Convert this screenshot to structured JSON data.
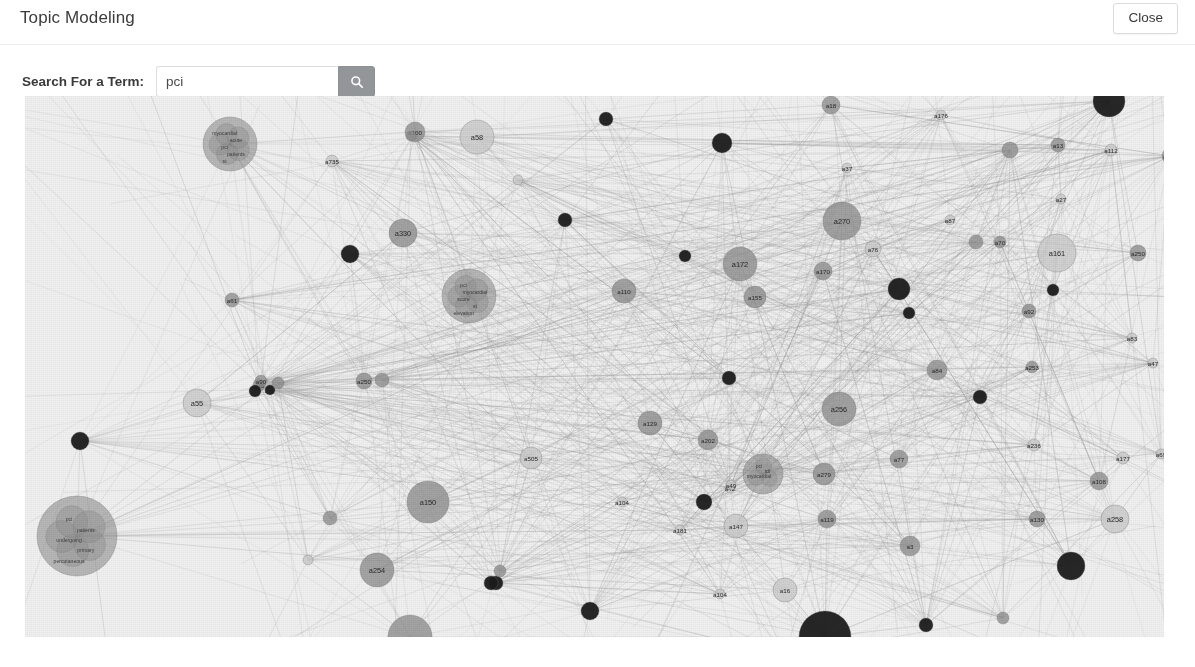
{
  "header": {
    "title": "Topic Modeling",
    "close_label": "Close"
  },
  "search": {
    "label": "Search For a Term:",
    "value": "pci",
    "placeholder": "",
    "button_icon": "search-icon"
  },
  "graph": {
    "type": "force-directed-network",
    "background_color": "#f1f1f1",
    "edge_color": "#9a9a9a",
    "node_fill_dark": "#1b1b1b",
    "node_fill_mid": "#8e8e8e",
    "node_fill_light": "#c9c9c9",
    "node_stroke": "#6f6f6f",
    "nodes": [
      {
        "id": "a137",
        "label": "a137",
        "x": 55,
        "y": 345,
        "r": 9,
        "tone": "dark"
      },
      {
        "id": "a55",
        "label": "a55",
        "x": 172,
        "y": 307,
        "r": 14,
        "tone": "light"
      },
      {
        "id": "a61",
        "label": "a61",
        "x": 207,
        "y": 204,
        "r": 7,
        "tone": "mid"
      },
      {
        "id": "a35",
        "label": "a35",
        "x": 234,
        "y": 289,
        "r": 6,
        "tone": "mid"
      },
      {
        "id": "a07",
        "label": "a07",
        "x": 245,
        "y": 294,
        "r": 5,
        "tone": "dark"
      },
      {
        "id": "a90",
        "label": "a90",
        "x": 236,
        "y": 285,
        "r": 6,
        "tone": "mid"
      },
      {
        "id": "c1",
        "label": "",
        "x": 205,
        "y": 48,
        "r": 27,
        "tone": "mid",
        "cluster": true,
        "terms": [
          "myocardial",
          "acute",
          "pci",
          "patients",
          "st"
        ]
      },
      {
        "id": "a735",
        "label": "a735",
        "x": 307,
        "y": 65,
        "r": 6,
        "tone": "light"
      },
      {
        "id": "a100",
        "label": "a100",
        "x": 390,
        "y": 36,
        "r": 10,
        "tone": "mid"
      },
      {
        "id": "a58",
        "label": "a58",
        "x": 452,
        "y": 41,
        "r": 17,
        "tone": "light"
      },
      {
        "id": "a330",
        "label": "a330",
        "x": 378,
        "y": 137,
        "r": 14,
        "tone": "mid"
      },
      {
        "id": "a81",
        "label": "",
        "x": 325,
        "y": 158,
        "r": 9,
        "tone": "dark"
      },
      {
        "id": "a250b",
        "label": "a250",
        "x": 339,
        "y": 285,
        "r": 8,
        "tone": "mid"
      },
      {
        "id": "a25",
        "label": "",
        "x": 230,
        "y": 295,
        "r": 6,
        "tone": "dark"
      },
      {
        "id": "a150",
        "label": "a150",
        "x": 403,
        "y": 406,
        "r": 21,
        "tone": "mid"
      },
      {
        "id": "a254",
        "label": "a254",
        "x": 352,
        "y": 474,
        "r": 17,
        "tone": "mid"
      },
      {
        "id": "a24",
        "label": "",
        "x": 305,
        "y": 422,
        "r": 7,
        "tone": "mid"
      },
      {
        "id": "c2",
        "label": "",
        "x": 444,
        "y": 200,
        "r": 27,
        "tone": "light",
        "cluster": true,
        "terms": [
          "pci",
          "myocardial",
          "score",
          "st",
          "elevation",
          "mi"
        ]
      },
      {
        "id": "a505",
        "label": "a505",
        "x": 506,
        "y": 362,
        "r": 11,
        "tone": "light"
      },
      {
        "id": "a99",
        "label": "",
        "x": 471,
        "y": 487,
        "r": 7,
        "tone": "dark"
      },
      {
        "id": "a270b",
        "label": "a270",
        "x": 565,
        "y": 515,
        "r": 9,
        "tone": "dark"
      },
      {
        "id": "a104",
        "label": "a104",
        "x": 597,
        "y": 406,
        "r": 5,
        "tone": "light"
      },
      {
        "id": "a110",
        "label": "a110",
        "x": 599,
        "y": 195,
        "r": 12,
        "tone": "mid"
      },
      {
        "id": "a172",
        "label": "a172",
        "x": 715,
        "y": 168,
        "r": 17,
        "tone": "mid"
      },
      {
        "id": "a155",
        "label": "a155",
        "x": 730,
        "y": 201,
        "r": 11,
        "tone": "mid"
      },
      {
        "id": "a170",
        "label": "a170",
        "x": 697,
        "y": 47,
        "r": 10,
        "tone": "dark"
      },
      {
        "id": "a129",
        "label": "a129",
        "x": 625,
        "y": 327,
        "r": 12,
        "tone": "mid"
      },
      {
        "id": "a202",
        "label": "a202",
        "x": 683,
        "y": 344,
        "r": 10,
        "tone": "mid"
      },
      {
        "id": "a42",
        "label": "a42",
        "x": 705,
        "y": 392,
        "r": 5,
        "tone": "light"
      },
      {
        "id": "a240",
        "label": "a240",
        "x": 679,
        "y": 406,
        "r": 8,
        "tone": "dark"
      },
      {
        "id": "a181",
        "label": "a181",
        "x": 655,
        "y": 434,
        "r": 5,
        "tone": "light"
      },
      {
        "id": "a147",
        "label": "a147",
        "x": 711,
        "y": 430,
        "r": 12,
        "tone": "light"
      },
      {
        "id": "a49",
        "label": "a49",
        "x": 706,
        "y": 389,
        "r": 5,
        "tone": "light"
      },
      {
        "id": "c3",
        "label": "",
        "x": 738,
        "y": 378,
        "r": 20,
        "tone": "mid",
        "cluster": true,
        "terms": [
          "pci",
          "tdi",
          "myocardial"
        ]
      },
      {
        "id": "a279",
        "label": "a279",
        "x": 799,
        "y": 378,
        "r": 11,
        "tone": "mid"
      },
      {
        "id": "a119",
        "label": "a119",
        "x": 802,
        "y": 423,
        "r": 9,
        "tone": "mid"
      },
      {
        "id": "a3",
        "label": "a3",
        "x": 885,
        "y": 450,
        "r": 10,
        "tone": "mid"
      },
      {
        "id": "a16",
        "label": "a16",
        "x": 760,
        "y": 494,
        "r": 12,
        "tone": "light"
      },
      {
        "id": "a104b",
        "label": "a104",
        "x": 695,
        "y": 498,
        "r": 5,
        "tone": "light"
      },
      {
        "id": "a173",
        "label": "a173",
        "x": 760,
        "y": 560,
        "r": 7,
        "tone": "mid"
      },
      {
        "id": "a256",
        "label": "a256",
        "x": 814,
        "y": 313,
        "r": 17,
        "tone": "mid"
      },
      {
        "id": "a270",
        "label": "a270",
        "x": 817,
        "y": 125,
        "r": 19,
        "tone": "mid"
      },
      {
        "id": "a76",
        "label": "a76",
        "x": 848,
        "y": 153,
        "r": 8,
        "tone": "light"
      },
      {
        "id": "a170b",
        "label": "a170",
        "x": 798,
        "y": 175,
        "r": 9,
        "tone": "mid"
      },
      {
        "id": "a48",
        "label": "a48",
        "x": 874,
        "y": 193,
        "r": 11,
        "tone": "dark"
      },
      {
        "id": "a18",
        "label": "a18",
        "x": 806,
        "y": 9,
        "r": 9,
        "tone": "mid"
      },
      {
        "id": "a37",
        "label": "a37",
        "x": 822,
        "y": 72,
        "r": 5,
        "tone": "light"
      },
      {
        "id": "a87",
        "label": "a87",
        "x": 925,
        "y": 124,
        "r": 5,
        "tone": "light"
      },
      {
        "id": "a70",
        "label": "a70",
        "x": 975,
        "y": 146,
        "r": 6,
        "tone": "mid"
      },
      {
        "id": "a176",
        "label": "a176",
        "x": 916,
        "y": 19,
        "r": 5,
        "tone": "light"
      },
      {
        "id": "a13",
        "label": "a13",
        "x": 1033,
        "y": 49,
        "r": 7,
        "tone": "mid"
      },
      {
        "id": "a112",
        "label": "a112",
        "x": 1086,
        "y": 54,
        "r": 6,
        "tone": "light"
      },
      {
        "id": "a160",
        "label": "a160",
        "x": 1145,
        "y": 60,
        "r": 8,
        "tone": "mid"
      },
      {
        "id": "a27",
        "label": "a27",
        "x": 1036,
        "y": 103,
        "r": 5,
        "tone": "light"
      },
      {
        "id": "a161",
        "label": "a161",
        "x": 1032,
        "y": 157,
        "r": 19,
        "tone": "light"
      },
      {
        "id": "a250",
        "label": "a250",
        "x": 1113,
        "y": 157,
        "r": 8,
        "tone": "mid"
      },
      {
        "id": "a90b",
        "label": "",
        "x": 1028,
        "y": 194,
        "r": 6,
        "tone": "dark"
      },
      {
        "id": "a92",
        "label": "a92",
        "x": 1004,
        "y": 215,
        "r": 7,
        "tone": "mid"
      },
      {
        "id": "a253",
        "label": "a253",
        "x": 1007,
        "y": 271,
        "r": 6,
        "tone": "mid"
      },
      {
        "id": "a83",
        "label": "a83",
        "x": 1107,
        "y": 242,
        "r": 5,
        "tone": "light"
      },
      {
        "id": "a47",
        "label": "a47",
        "x": 1128,
        "y": 267,
        "r": 5,
        "tone": "light"
      },
      {
        "id": "a84",
        "label": "a84",
        "x": 912,
        "y": 274,
        "r": 10,
        "tone": "mid"
      },
      {
        "id": "a236",
        "label": "a236",
        "x": 1009,
        "y": 349,
        "r": 6,
        "tone": "light"
      },
      {
        "id": "a177",
        "label": "a177",
        "x": 1098,
        "y": 362,
        "r": 6,
        "tone": "light"
      },
      {
        "id": "a69",
        "label": "a69",
        "x": 1136,
        "y": 358,
        "r": 5,
        "tone": "light"
      },
      {
        "id": "a108",
        "label": "a108",
        "x": 1074,
        "y": 385,
        "r": 9,
        "tone": "mid"
      },
      {
        "id": "a130",
        "label": "a130",
        "x": 1012,
        "y": 423,
        "r": 8,
        "tone": "mid"
      },
      {
        "id": "a258",
        "label": "a258",
        "x": 1090,
        "y": 423,
        "r": 14,
        "tone": "light"
      },
      {
        "id": "a262",
        "label": "a262",
        "x": 1046,
        "y": 470,
        "r": 14,
        "tone": "dark"
      },
      {
        "id": "a890",
        "label": "",
        "x": 955,
        "y": 301,
        "r": 7,
        "tone": "dark"
      },
      {
        "id": "a77",
        "label": "a77",
        "x": 874,
        "y": 363,
        "r": 9,
        "tone": "mid"
      },
      {
        "id": "a57",
        "label": "",
        "x": 884,
        "y": 217,
        "r": 6,
        "tone": "dark"
      },
      {
        "id": "a51",
        "label": "",
        "x": 951,
        "y": 146,
        "r": 7,
        "tone": "mid"
      },
      {
        "id": "a66",
        "label": "",
        "x": 704,
        "y": 282,
        "r": 7,
        "tone": "dark"
      },
      {
        "id": "a78",
        "label": "",
        "x": 660,
        "y": 160,
        "r": 6,
        "tone": "dark"
      },
      {
        "id": "a63",
        "label": "",
        "x": 581,
        "y": 23,
        "r": 7,
        "tone": "dark"
      },
      {
        "id": "a95",
        "label": "",
        "x": 540,
        "y": 124,
        "r": 7,
        "tone": "dark"
      },
      {
        "id": "a96",
        "label": "",
        "x": 493,
        "y": 84,
        "r": 5,
        "tone": "light"
      },
      {
        "id": "a113",
        "label": "",
        "x": 386,
        "y": 40,
        "r": 5,
        "tone": "mid"
      },
      {
        "id": "a150b",
        "label": "",
        "x": 357,
        "y": 284,
        "r": 7,
        "tone": "mid"
      },
      {
        "id": "a31",
        "label": "",
        "x": 253,
        "y": 287,
        "r": 6,
        "tone": "mid"
      },
      {
        "id": "a199",
        "label": "",
        "x": 1084,
        "y": 5,
        "r": 16,
        "tone": "dark"
      },
      {
        "id": "a200",
        "label": "",
        "x": 985,
        "y": 54,
        "r": 8,
        "tone": "mid"
      },
      {
        "id": "a251",
        "label": "",
        "x": 466,
        "y": 487,
        "r": 7,
        "tone": "dark"
      },
      {
        "id": "a77b",
        "label": "",
        "x": 283,
        "y": 464,
        "r": 5,
        "tone": "light"
      },
      {
        "id": "c4",
        "label": "",
        "x": 52,
        "y": 440,
        "r": 40,
        "tone": "mid",
        "cluster": true,
        "terms": [
          "pci",
          "patients",
          "undergoing",
          "primary",
          "percutaneous"
        ]
      },
      {
        "id": "a11",
        "label": "",
        "x": 385,
        "y": 541,
        "r": 22,
        "tone": "mid"
      },
      {
        "id": "a200b",
        "label": "",
        "x": 800,
        "y": 541,
        "r": 26,
        "tone": "dark"
      },
      {
        "id": "a112b",
        "label": "",
        "x": 901,
        "y": 529,
        "r": 7,
        "tone": "dark"
      },
      {
        "id": "a98",
        "label": "",
        "x": 978,
        "y": 522,
        "r": 6,
        "tone": "mid"
      },
      {
        "id": "a215",
        "label": "",
        "x": 475,
        "y": 475,
        "r": 6,
        "tone": "mid"
      }
    ]
  }
}
